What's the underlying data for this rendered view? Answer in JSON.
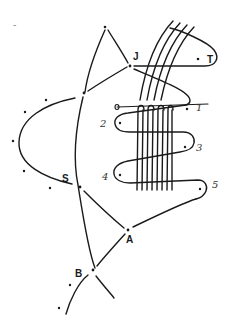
{
  "diagram": {
    "node_labels": {
      "J": "J",
      "T": "T",
      "S": "S",
      "A": "A",
      "B": "B"
    },
    "loop_labels": {
      "l1": "1",
      "l2": "2",
      "l3": "3",
      "l4": "4",
      "l5": "5"
    },
    "stray_mark": "-",
    "colors": {
      "ink": "#1a1a1a",
      "background": "#ffffff"
    }
  }
}
